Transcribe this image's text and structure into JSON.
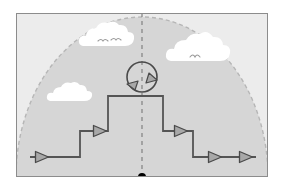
{
  "figure": {
    "type": "schematic-diagram",
    "canvas": {
      "width": 284,
      "height": 190
    },
    "colors": {
      "page_background": "#ffffff",
      "frame_stroke": "#8c8c8c",
      "frame_fill_outside_dome": "#ececec",
      "dome_fill": "#d6d6d6",
      "dome_dash_stroke": "#b6b6b6",
      "path_stroke": "#555555",
      "arrow_fill": "#a8a8a8",
      "arrow_stroke": "#4a4a4a",
      "axis_dash_stroke": "#808080",
      "origin_dot": "#000000",
      "cloud_fill": "#ffffff",
      "bird_stroke": "#9a9a9a"
    },
    "frame": {
      "x": 16,
      "y": 13,
      "width": 252,
      "height": 164,
      "stroke_width": 2
    },
    "dome": {
      "center_x": 142,
      "base_y": 177,
      "radius_x": 126,
      "radius_y": 160,
      "dash": "4 3",
      "label": "dashed semicircular boundary"
    },
    "axis": {
      "label": "vertical dashed centerline",
      "x": 142,
      "y_top": 13,
      "y_bottom": 177,
      "dash": "4 4"
    },
    "origin": {
      "label": "origin marker",
      "x": 142,
      "y": 177,
      "radius": 4
    },
    "rotation_marker": {
      "label": "circular rotation arrows at apex",
      "center_x": 142,
      "center_y": 77,
      "radius": 15,
      "arrowheads": 2
    },
    "path": {
      "label": "symmetric staircase path",
      "levels": {
        "bottom_y": 157,
        "mid_y": 131,
        "top_y": 96
      },
      "x_points": {
        "left_end": 30,
        "left_riser": 80,
        "plateau_left": 108,
        "plateau_right": 163,
        "right_riser": 193,
        "right_end": 256
      },
      "arrow_markers": [
        {
          "name": "arrow-left-bottom",
          "x": 42,
          "y": 157,
          "dir": "right"
        },
        {
          "name": "arrow-left-mid",
          "x": 100,
          "y": 131,
          "dir": "right"
        },
        {
          "name": "arrow-right-mid",
          "x": 181,
          "y": 131,
          "dir": "right"
        },
        {
          "name": "arrow-right-bottom-inner",
          "x": 215,
          "y": 157,
          "dir": "right"
        },
        {
          "name": "arrow-right-bottom-outer",
          "x": 246,
          "y": 157,
          "dir": "right"
        }
      ]
    },
    "clouds": [
      {
        "name": "cloud-upper-left",
        "cx": 103,
        "cy": 44,
        "scale": 1.0,
        "birds": 2
      },
      {
        "name": "cloud-upper-right",
        "cx": 196,
        "cy": 56,
        "scale": 1.15,
        "birds": 1
      },
      {
        "name": "cloud-mid-left",
        "cx": 64,
        "cy": 95,
        "scale": 0.8,
        "birds": 0
      }
    ]
  }
}
